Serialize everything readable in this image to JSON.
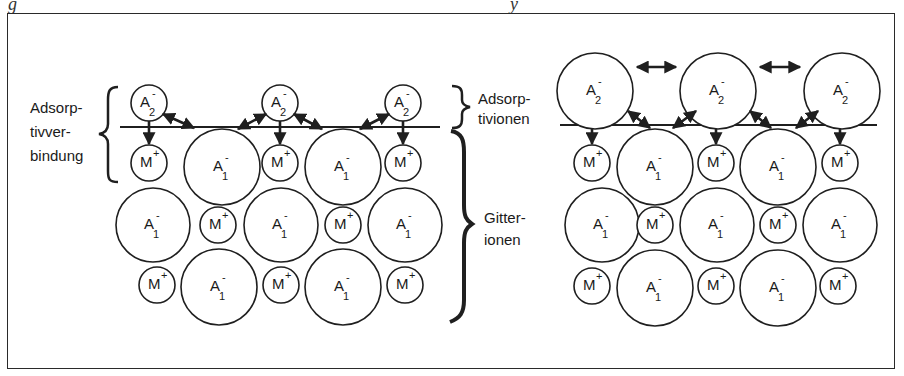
{
  "caption_fragments": [
    "g",
    "y"
  ],
  "labels": {
    "adsorptivverbindung": [
      "Adsorp-",
      "tivver-",
      "bindung"
    ],
    "adsorptivionen": [
      "Adsorp-",
      "tivionen"
    ],
    "gitterionen": [
      "Gitter-",
      "ionen"
    ]
  },
  "ions": {
    "anion_adsorbed": {
      "base": "A",
      "sub": "2",
      "sup": "-"
    },
    "anion_lattice": {
      "base": "A",
      "sub": "1",
      "sup": "-"
    },
    "cation_lattice": {
      "base": "M",
      "sup": "+"
    }
  },
  "panels": [
    {
      "name": "left-small-adsorptive-ions",
      "surface_y": 127,
      "surface_x": [
        120,
        440
      ],
      "adsorbed": [
        {
          "type": "A2",
          "cx": 149,
          "cy": 103,
          "r": 18
        },
        {
          "type": "A2",
          "cx": 280,
          "cy": 103,
          "r": 18
        },
        {
          "type": "A2",
          "cx": 403,
          "cy": 103,
          "r": 18
        }
      ],
      "lattice": [
        {
          "type": "M",
          "cx": 149,
          "cy": 163,
          "r": 18
        },
        {
          "type": "A1",
          "cx": 222,
          "cy": 167,
          "r": 38
        },
        {
          "type": "M",
          "cx": 280,
          "cy": 163,
          "r": 18
        },
        {
          "type": "A1",
          "cx": 343,
          "cy": 167,
          "r": 38
        },
        {
          "type": "M",
          "cx": 403,
          "cy": 163,
          "r": 18
        },
        {
          "type": "A1",
          "cx": 153,
          "cy": 225,
          "r": 37
        },
        {
          "type": "M",
          "cx": 218,
          "cy": 225,
          "r": 18
        },
        {
          "type": "A1",
          "cx": 281,
          "cy": 225,
          "r": 37
        },
        {
          "type": "M",
          "cx": 343,
          "cy": 225,
          "r": 18
        },
        {
          "type": "A1",
          "cx": 405,
          "cy": 225,
          "r": 37
        },
        {
          "type": "M",
          "cx": 157,
          "cy": 285,
          "r": 18
        },
        {
          "type": "A1",
          "cx": 219,
          "cy": 287,
          "r": 38
        },
        {
          "type": "M",
          "cx": 281,
          "cy": 285,
          "r": 18
        },
        {
          "type": "A1",
          "cx": 343,
          "cy": 287,
          "r": 38
        },
        {
          "type": "M",
          "cx": 405,
          "cy": 285,
          "r": 18
        }
      ]
    },
    {
      "name": "right-large-adsorptive-ions",
      "surface_y": 125,
      "surface_x": [
        560,
        877
      ],
      "adsorbed": [
        {
          "type": "A2",
          "cx": 595,
          "cy": 91,
          "r": 38
        },
        {
          "type": "A2",
          "cx": 718,
          "cy": 91,
          "r": 38
        },
        {
          "type": "A2",
          "cx": 842,
          "cy": 91,
          "r": 38
        }
      ],
      "lattice": [
        {
          "type": "M",
          "cx": 592,
          "cy": 163,
          "r": 18
        },
        {
          "type": "A1",
          "cx": 655,
          "cy": 167,
          "r": 38
        },
        {
          "type": "M",
          "cx": 716,
          "cy": 163,
          "r": 18
        },
        {
          "type": "A1",
          "cx": 778,
          "cy": 167,
          "r": 38
        },
        {
          "type": "M",
          "cx": 840,
          "cy": 163,
          "r": 18
        },
        {
          "type": "A1",
          "cx": 602,
          "cy": 225,
          "r": 37
        },
        {
          "type": "M",
          "cx": 655,
          "cy": 225,
          "r": 18
        },
        {
          "type": "A1",
          "cx": 717,
          "cy": 225,
          "r": 37
        },
        {
          "type": "M",
          "cx": 778,
          "cy": 225,
          "r": 18
        },
        {
          "type": "A1",
          "cx": 840,
          "cy": 225,
          "r": 37
        },
        {
          "type": "M",
          "cx": 592,
          "cy": 286,
          "r": 18
        },
        {
          "type": "A1",
          "cx": 655,
          "cy": 288,
          "r": 38
        },
        {
          "type": "M",
          "cx": 716,
          "cy": 286,
          "r": 18
        },
        {
          "type": "A1",
          "cx": 778,
          "cy": 288,
          "r": 38
        },
        {
          "type": "M",
          "cx": 838,
          "cy": 286,
          "r": 18
        }
      ]
    }
  ],
  "arrows": {
    "left": {
      "down": [
        [
          149,
          121,
          149,
          144
        ],
        [
          280,
          121,
          280,
          144
        ],
        [
          403,
          121,
          403,
          144
        ]
      ],
      "attract": [
        [
          163,
          114,
          194,
          128
        ],
        [
          266,
          114,
          238,
          129
        ],
        [
          294,
          114,
          322,
          129
        ],
        [
          389,
          114,
          360,
          129
        ]
      ]
    },
    "right": {
      "down": [
        [
          592,
          129,
          592,
          144
        ],
        [
          716,
          129,
          716,
          144
        ],
        [
          840,
          129,
          840,
          144
        ]
      ],
      "repel": [
        [
          637,
          67,
          676,
          67
        ],
        [
          760,
          67,
          800,
          67
        ]
      ],
      "attract": [
        [
          628,
          111,
          650,
          128
        ],
        [
          673,
          128,
          696,
          111
        ],
        [
          750,
          111,
          771,
          128
        ],
        [
          796,
          128,
          818,
          111
        ]
      ]
    }
  },
  "colors": {
    "stroke": "#1f1f1f",
    "background": "#ffffff"
  }
}
